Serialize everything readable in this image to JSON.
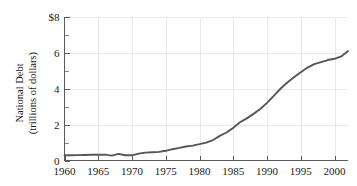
{
  "chart_data": {
    "type": "line",
    "title": "",
    "subtitle": "",
    "xlabel": "",
    "ylabel": "National Debt (trillions of dollars)",
    "ylabel_lines": [
      "National Debt",
      "(trillions of dollars)"
    ],
    "xlim": [
      1960,
      2002
    ],
    "ylim": [
      0,
      8
    ],
    "grid": true,
    "legend": "none",
    "y_tick_labels": [
      "0",
      "2",
      "4",
      "6",
      "$8"
    ],
    "y_tick_values": [
      0,
      2,
      4,
      6,
      8
    ],
    "y_minor_tick_values": [
      1,
      3,
      5,
      7
    ],
    "x_tick_labels": [
      "1960",
      "1965",
      "1970",
      "1975",
      "1980",
      "1985",
      "1990",
      "1995",
      "2000"
    ],
    "x_tick_values": [
      1960,
      1965,
      1970,
      1975,
      1980,
      1985,
      1990,
      1995,
      2000
    ],
    "series": [
      {
        "name": "National Debt",
        "color": "#565656",
        "x": [
          1960,
          1961,
          1962,
          1963,
          1964,
          1965,
          1966,
          1967,
          1968,
          1969,
          1970,
          1971,
          1972,
          1973,
          1974,
          1975,
          1976,
          1977,
          1978,
          1979,
          1980,
          1981,
          1982,
          1983,
          1984,
          1985,
          1986,
          1987,
          1988,
          1989,
          1990,
          1991,
          1992,
          1993,
          1994,
          1995,
          1996,
          1997,
          1998,
          1999,
          2000,
          2001,
          2002
        ],
        "values": [
          0.29,
          0.29,
          0.3,
          0.31,
          0.32,
          0.32,
          0.33,
          0.27,
          0.37,
          0.29,
          0.29,
          0.38,
          0.44,
          0.46,
          0.48,
          0.54,
          0.63,
          0.7,
          0.78,
          0.83,
          0.91,
          1.0,
          1.14,
          1.37,
          1.56,
          1.82,
          2.13,
          2.35,
          2.6,
          2.87,
          3.21,
          3.6,
          4.0,
          4.35,
          4.64,
          4.92,
          5.18,
          5.37,
          5.48,
          5.6,
          5.67,
          5.8,
          6.1
        ]
      }
    ]
  }
}
